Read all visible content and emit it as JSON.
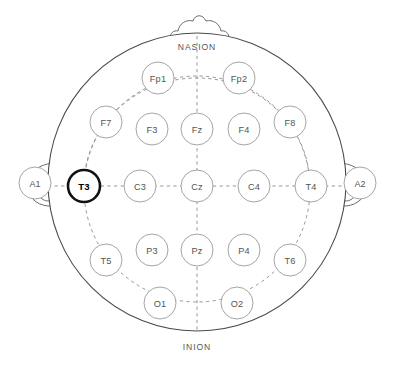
{
  "diagram": {
    "view": "top-down head map",
    "landmarks": {
      "top": "NASION",
      "bottom": "INION"
    },
    "colors": {
      "background": "#ffffff",
      "outline": "#4a4a4a",
      "guide_dash": "#8a8a8a",
      "electrode_stroke": "#9a9a9a",
      "electrode_fill": "#ffffff",
      "label_text": "#555555",
      "highlight_stroke": "#111111",
      "highlight_text": "#000000"
    },
    "head": {
      "cx": 197,
      "cy": 182,
      "r": 149
    },
    "inner_rings": [
      {
        "name": "outer-dashed-ring",
        "cx": 197,
        "cy": 182,
        "r": 111
      },
      {
        "name": "inner-dashed-ring",
        "cx": 197,
        "cy": 182,
        "r": 111
      }
    ],
    "electrodes": [
      {
        "id": "Fp1",
        "label": "Fp1",
        "cx": 158,
        "cy": 78,
        "r": 16,
        "highlighted": false
      },
      {
        "id": "Fp2",
        "label": "Fp2",
        "cx": 239,
        "cy": 78,
        "r": 16,
        "highlighted": false
      },
      {
        "id": "F7",
        "label": "F7",
        "cx": 106,
        "cy": 122,
        "r": 16,
        "highlighted": false
      },
      {
        "id": "F3",
        "label": "F3",
        "cx": 152,
        "cy": 129,
        "r": 16,
        "highlighted": false
      },
      {
        "id": "Fz",
        "label": "Fz",
        "cx": 197,
        "cy": 129,
        "r": 16,
        "highlighted": false
      },
      {
        "id": "F4",
        "label": "F4",
        "cx": 244,
        "cy": 129,
        "r": 16,
        "highlighted": false
      },
      {
        "id": "F8",
        "label": "F8",
        "cx": 290,
        "cy": 122,
        "r": 16,
        "highlighted": false
      },
      {
        "id": "T3",
        "label": "T3",
        "cx": 84,
        "cy": 186,
        "r": 16,
        "highlighted": true
      },
      {
        "id": "C3",
        "label": "C3",
        "cx": 140,
        "cy": 186,
        "r": 16,
        "highlighted": false
      },
      {
        "id": "Cz",
        "label": "Cz",
        "cx": 197,
        "cy": 186,
        "r": 16,
        "highlighted": false
      },
      {
        "id": "C4",
        "label": "C4",
        "cx": 254,
        "cy": 186,
        "r": 16,
        "highlighted": false
      },
      {
        "id": "T4",
        "label": "T4",
        "cx": 311,
        "cy": 186,
        "r": 16,
        "highlighted": false
      },
      {
        "id": "T5",
        "label": "T5",
        "cx": 106,
        "cy": 260,
        "r": 16,
        "highlighted": false
      },
      {
        "id": "P3",
        "label": "P3",
        "cx": 152,
        "cy": 250,
        "r": 16,
        "highlighted": false
      },
      {
        "id": "Pz",
        "label": "Pz",
        "cx": 197,
        "cy": 250,
        "r": 16,
        "highlighted": false
      },
      {
        "id": "P4",
        "label": "P4",
        "cx": 244,
        "cy": 250,
        "r": 16,
        "highlighted": false
      },
      {
        "id": "T6",
        "label": "T6",
        "cx": 290,
        "cy": 260,
        "r": 16,
        "highlighted": false
      },
      {
        "id": "O1",
        "label": "O1",
        "cx": 160,
        "cy": 303,
        "r": 16,
        "highlighted": false
      },
      {
        "id": "O2",
        "label": "O2",
        "cx": 237,
        "cy": 303,
        "r": 16,
        "highlighted": false
      }
    ],
    "references": [
      {
        "id": "A1",
        "label": "A1",
        "cx": 35,
        "cy": 183,
        "r": 16,
        "side": "left"
      },
      {
        "id": "A2",
        "label": "A2",
        "cx": 360,
        "cy": 183,
        "r": 16,
        "side": "right"
      }
    ],
    "selected_electrode": "T3"
  }
}
